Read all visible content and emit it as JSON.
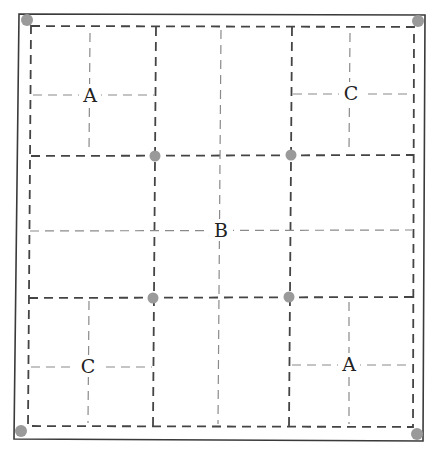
{
  "diagram": {
    "type": "grid-partition",
    "labels": {
      "top_left": "A",
      "top_right": "C",
      "center": "B",
      "bottom_left": "C",
      "bottom_right": "A"
    },
    "colors": {
      "outline": "#3a3a3a",
      "heavy_dash": "#444444",
      "light_dash": "#8a8a8a",
      "dot": "#9a9a9a",
      "text": "#222222"
    },
    "points": [
      {
        "name": "corner-top-left",
        "x": 27,
        "y": 20
      },
      {
        "name": "corner-top-right",
        "x": 418,
        "y": 21
      },
      {
        "name": "corner-bottom-left",
        "x": 21,
        "y": 431
      },
      {
        "name": "corner-bottom-right",
        "x": 417,
        "y": 434
      },
      {
        "name": "inner-top-left",
        "x": 155,
        "y": 156
      },
      {
        "name": "inner-top-right",
        "x": 291,
        "y": 155
      },
      {
        "name": "inner-bottom-left",
        "x": 153,
        "y": 298
      },
      {
        "name": "inner-bottom-right",
        "x": 289,
        "y": 297
      }
    ]
  }
}
